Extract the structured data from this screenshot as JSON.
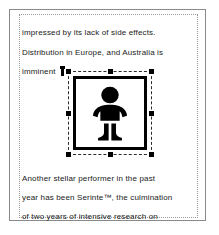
{
  "document": {
    "lines": [
      {
        "id": "line-1",
        "text": "impressed by its lack of side effects."
      },
      {
        "id": "line-2",
        "text": "Distribution in Europe, and Australia is"
      },
      {
        "id": "line-3",
        "text": "imminent"
      },
      {
        "id": "line-4",
        "text": "Another stellar performer in the past"
      },
      {
        "id": "line-5",
        "text": "year has been Serinte™, the culmination"
      },
      {
        "id": "line-6",
        "text": "of two years of intensive research on"
      }
    ]
  },
  "selection": {
    "object_type": "image",
    "icon_name": "baby-pictogram-icon",
    "state": "selected",
    "handle_count": 8,
    "handles": [
      "nw",
      "n",
      "ne",
      "w",
      "e",
      "sw",
      "s",
      "se"
    ],
    "border_style": "dashed"
  },
  "caret": {
    "name": "text-cursor",
    "visible": true
  },
  "colors": {
    "page_background": "#ffffff",
    "page_border": "#8a8a8a",
    "text_frame_border": "#9a9a9a",
    "text": "#1a1a1a",
    "selection_handle": "#000000",
    "selection_border": "#2b2b2b",
    "pictogram": "#000000"
  }
}
